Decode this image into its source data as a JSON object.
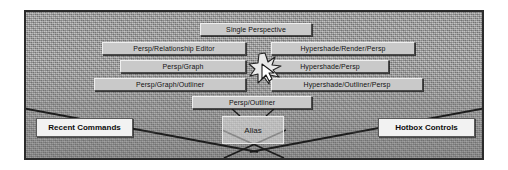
{
  "app": {
    "title": "Maya Hotbox — Perspective layouts",
    "center_logo": "Alias"
  },
  "hotbox": {
    "top": {
      "label": "Single Perspective"
    },
    "rows": [
      {
        "left": "Persp/Relationship Editor",
        "right": "Hypershade/Render/Persp"
      },
      {
        "left": "Persp/Graph",
        "right": "Hypershade/Persp"
      },
      {
        "left": "Persp/Graph/Outliner",
        "right": "Hypershade/Outliner/Persp"
      }
    ],
    "bottom": {
      "label": "Persp/Outliner"
    }
  },
  "zones": {
    "recent_commands": "Recent Commands",
    "hotbox_controls": "Hotbox Controls"
  },
  "icons": {
    "sparkle": "sparkle-burst-icon",
    "cursor": "arrow-cursor-icon"
  },
  "colors": {
    "frame_border": "#2b2b2b",
    "ground": "#9d9d9d",
    "button_face": "#c9c9c9",
    "label_face": "#f2f2f2",
    "line": "#1d1d1d"
  }
}
